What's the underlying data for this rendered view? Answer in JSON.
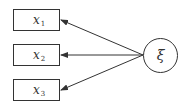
{
  "diagram": {
    "type": "path-diagram",
    "latent": {
      "id": "xi",
      "label": "ξ",
      "shape": "circle"
    },
    "indicators": [
      {
        "id": "x1",
        "base": "x",
        "sub": "1",
        "shape": "rectangle"
      },
      {
        "id": "x2",
        "base": "x",
        "sub": "2",
        "shape": "rectangle"
      },
      {
        "id": "x3",
        "base": "x",
        "sub": "3",
        "shape": "rectangle"
      }
    ],
    "edges": [
      {
        "from": "xi",
        "to": "x1",
        "arrow": "end"
      },
      {
        "from": "xi",
        "to": "x2",
        "arrow": "end"
      },
      {
        "from": "xi",
        "to": "x3",
        "arrow": "end"
      }
    ],
    "colors": {
      "stroke": "#333333",
      "background": "#ffffff"
    }
  }
}
